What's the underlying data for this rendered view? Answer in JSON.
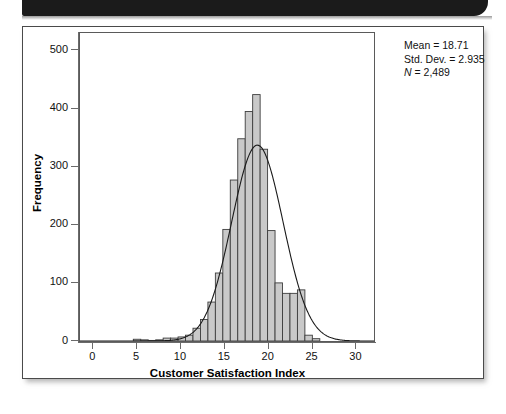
{
  "figure": {
    "y_axis_title": "Frequency",
    "x_axis_title": "Customer Satisfaction Index"
  },
  "stats": {
    "mean_line": "Mean = 18.71",
    "stddev_line": "Std. Dev. = 2.935",
    "n_symbol": "N",
    "n_value": " = 2,489"
  },
  "chart_data": {
    "type": "bar",
    "title": "",
    "subtitle": "",
    "xlabel": "Customer Satisfaction Index",
    "ylabel": "Frequency",
    "xlim": [
      -1.5,
      32
    ],
    "ylim": [
      0,
      530
    ],
    "xticks": [
      0,
      5,
      10,
      15,
      20,
      25,
      30
    ],
    "xtick_labels": [
      "0",
      "5",
      "10",
      "15",
      "20",
      "25",
      "30"
    ],
    "yticks": [
      0,
      100,
      200,
      300,
      400,
      500
    ],
    "ytick_labels": [
      "0",
      "100",
      "200",
      "300",
      "400",
      "500"
    ],
    "grid": false,
    "legend": "none",
    "bar_fill": "#c9c9c9",
    "bar_edge": "#3d3d3d",
    "curve_color": "#1a1a1a",
    "bin_width": 0.85,
    "bin_centers": [
      5.0,
      5.85,
      6.7,
      7.55,
      8.4,
      9.25,
      10.1,
      10.95,
      11.8,
      12.65,
      13.5,
      14.35,
      15.2,
      16.05,
      16.9,
      17.75,
      18.6,
      19.45,
      20.3,
      21.15,
      22.0,
      22.85,
      23.7,
      24.55,
      25.4
    ],
    "values": [
      3,
      2,
      1,
      2,
      5,
      5,
      7,
      10,
      22,
      37,
      67,
      117,
      192,
      277,
      348,
      395,
      424,
      330,
      190,
      100,
      82,
      82,
      88,
      10,
      4
    ],
    "normal_curve": {
      "mean": 18.71,
      "std_dev": 2.935,
      "n": 2489,
      "peak_value": 337
    },
    "annotations": [
      "Mean = 18.71",
      "Std. Dev. = 2.935",
      "N = 2,489"
    ]
  }
}
